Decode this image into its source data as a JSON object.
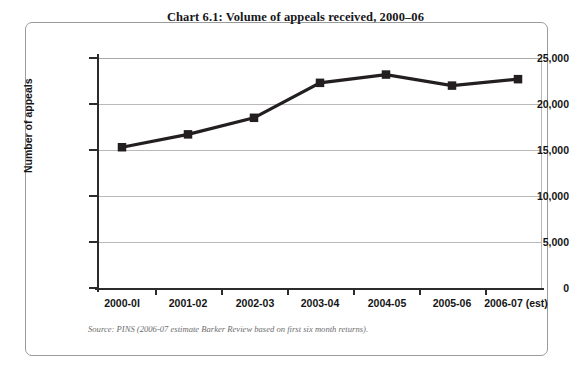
{
  "figure": {
    "title": "Chart 6.1: Volume of appeals received, 2000–06",
    "source_note": "Source: PINS (2006-07 estimate Barker Review based on first six month returns).",
    "frame_color": "#9a9a9a",
    "line_color": "#231f20",
    "grid_color": "#b9b9b9",
    "axis_color": "#2b2b2b"
  },
  "chart_data": {
    "type": "line",
    "title": "Chart 6.1: Volume of appeals received, 2000–06",
    "xlabel": "",
    "ylabel": "Number of appeals",
    "categories": [
      "2000-0I",
      "2001-02",
      "2002-03",
      "2003-04",
      "2004-05",
      "2005-06",
      "2006-07 (est)"
    ],
    "values": [
      15300,
      16700,
      18500,
      22300,
      23200,
      22000,
      22700
    ],
    "series": [
      {
        "name": "Number of appeals",
        "values": [
          15300,
          16700,
          18500,
          22300,
          23200,
          22000,
          22700
        ],
        "marker": "square",
        "color": "#231f20"
      }
    ],
    "ylim": [
      0,
      25000
    ],
    "yticks": [
      0,
      5000,
      10000,
      15000,
      20000,
      25000
    ],
    "ytick_labels": [
      "0",
      "5,000",
      "10,000",
      "15,000",
      "20,000",
      "25,000"
    ],
    "grid": "horizontal",
    "legend": "none"
  }
}
